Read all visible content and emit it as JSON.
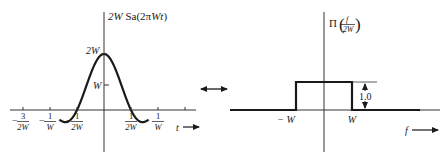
{
  "chart_data": [
    {
      "type": "line",
      "title": "2W Sa(2πWt)",
      "function": "2W·Sa(2πWt)",
      "xlabel": "t",
      "ylabel": "2W Sa(2πWt)",
      "y_ticks": [
        {
          "label": "2W",
          "value": 2
        },
        {
          "label": "W",
          "value": 1
        }
      ],
      "x_ticks": [
        {
          "label_num": "3",
          "label_den": "2W",
          "sign": "−",
          "value": -1.5
        },
        {
          "label_num": "1",
          "label_den": "W",
          "sign": "−",
          "value": -1.0
        },
        {
          "label_num": "1",
          "label_den": "2W",
          "sign": "−",
          "value": -0.5
        },
        {
          "label_num": "1",
          "label_den": "2W",
          "sign": "",
          "value": 0.5
        },
        {
          "label_num": "1",
          "label_den": "W",
          "sign": "",
          "value": 1.0
        }
      ],
      "x_range_in_units_of_1_over_2W": [
        -1.65,
        1.65
      ],
      "y_range_in_units_of_W": [
        -0.6,
        2.0
      ]
    },
    {
      "type": "line",
      "title": "Π(f/2W)",
      "function": "Π(f/2W)",
      "ylabel_prefix": "Π",
      "ylabel_num": "f",
      "ylabel_den": "2W",
      "xlabel": "f",
      "x_ticks": [
        {
          "label": "− W",
          "value": -1
        },
        {
          "label": "W",
          "value": 1
        }
      ],
      "amplitude": 1.0,
      "amplitude_label": "1.0",
      "x_range_in_units_of_W": [
        -3.4,
        3.4
      ]
    }
  ],
  "transform_pair": {
    "symbol": "double-arrow"
  }
}
